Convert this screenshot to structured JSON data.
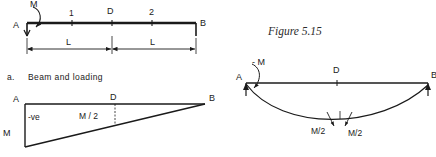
{
  "figure": {
    "caption": "Figure 5.15",
    "background_color": "#ffffff",
    "ink_color": "#1a1a1a"
  },
  "panel_a": {
    "caption_letter": "a.",
    "caption_text": "Beam  and  loading",
    "support_labels": {
      "left": "A",
      "right": "B"
    },
    "moment_label": "M",
    "station_labels": {
      "left_quarter": "1",
      "midspan": "D",
      "right_quarter": "2"
    },
    "dimensions": [
      {
        "label": "L"
      },
      {
        "label": "L"
      }
    ]
  },
  "panel_bmd": {
    "support_labels": {
      "left": "A",
      "right": "B"
    },
    "midspan_label": "D",
    "sign_label": "-ve",
    "ordinate_start": "M",
    "ordinate_mid": "M / 2"
  },
  "panel_deflection": {
    "support_labels": {
      "left": "A",
      "right": "B"
    },
    "midspan_label": "D",
    "applied_moment_label": "- M",
    "slope_labels": [
      {
        "label": "M/2"
      },
      {
        "label": "M/2"
      }
    ]
  }
}
